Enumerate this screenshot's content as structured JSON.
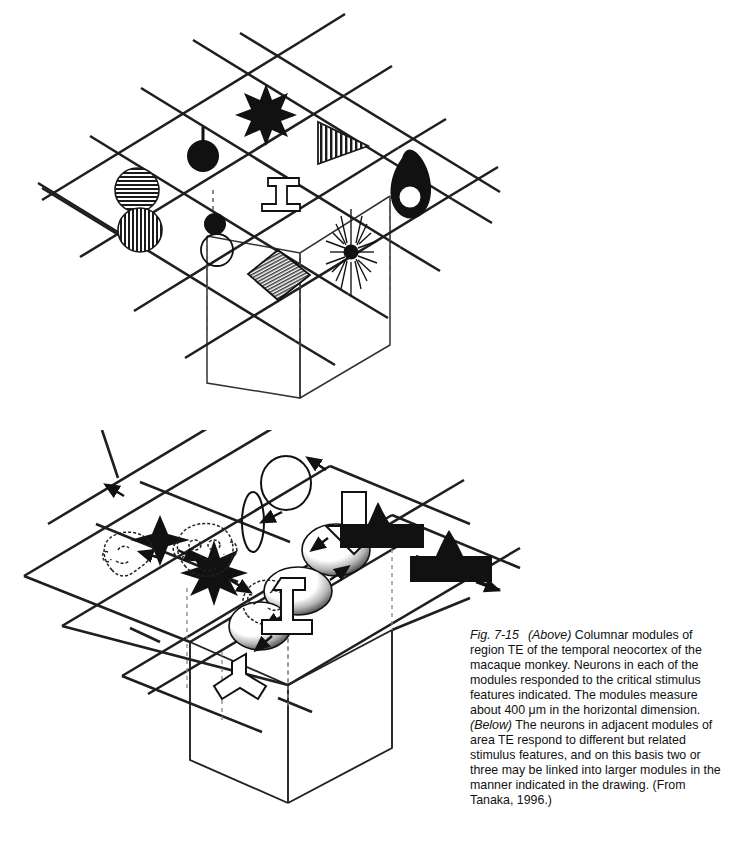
{
  "figure": {
    "number": "Fig. 7-15",
    "caption_segments": [
      {
        "text": "Fig. 7-15",
        "style": "italic"
      },
      {
        "text": "(Above)",
        "style": "italic"
      },
      {
        "text": "Columnar modules of region TE of the temporal neocortex of the macaque monkey. Neurons in each of the modules responded to the critical stimulus features indicated. The modules measure about 400 μm in the horizontal dimension.",
        "style": "normal"
      },
      {
        "text": "(Below)",
        "style": "italic"
      },
      {
        "text": "The neurons in adjacent modules of area TE respond to different but related stimulus features, and on this basis two or three may be linked into larger modules in the manner indicated in the drawing. (From Tanaka, 1996.)",
        "style": "normal"
      }
    ],
    "caption_full": "Fig. 7-15   (Above) Columnar modules of region TE of the temporal neocortex of the macaque monkey. Neurons in each of the modules responded to the critical stimulus features indicated. The modules measure about 400 μm in the horizontal dimension. (Below) The neurons in adjacent modules of area TE respond to different but related stimulus features, and on this basis two or three may be linked into larger modules in the manner indicated in the drawing. (From Tanaka, 1996.)",
    "measurement": "400 μm",
    "source": "Tanaka, 1996.",
    "region": "TE",
    "species": "macaque monkey"
  },
  "colors": {
    "ink": "#1a1a1a",
    "line": "#222222",
    "fill_black": "#111111",
    "paper": "#ffffff",
    "hatch_gray": "#555555",
    "dashed": "#777777"
  },
  "panel_above": {
    "label": "Above",
    "description": "Isometric grid of cortical columnar modules with a 3D column extending downward",
    "modules": [
      {
        "id": "m1",
        "feature": "striped-double-circle",
        "description": "horizontally striped circle above vertically striped circle"
      },
      {
        "id": "m2",
        "feature": "black-circle-with-stem",
        "description": "filled black disc with vertical stem above"
      },
      {
        "id": "m3",
        "feature": "eight-point-star",
        "description": "filled black eight-pointed star"
      },
      {
        "id": "m4",
        "feature": "small-black-disc-and-open-circle",
        "description": "small filled disc above an open outline circle"
      },
      {
        "id": "m5",
        "feature": "t-shape-outline",
        "description": "outline inverted T shape"
      },
      {
        "id": "m6",
        "feature": "striped-triangle",
        "description": "right-pointing triangle with vertical stripes"
      },
      {
        "id": "m7",
        "feature": "hatched-diamond",
        "description": "diamond filled with fine hatching"
      },
      {
        "id": "m8",
        "feature": "radial-starburst",
        "description": "starburst with many fine radiating lines"
      },
      {
        "id": "m9",
        "feature": "black-blob-with-hole",
        "description": "filled black rounded blob containing white circle"
      }
    ]
  },
  "panel_below": {
    "label": "Below",
    "description": "Adjacent modules linked into larger modules, connected by arrows",
    "groups": [
      {
        "id": "g1",
        "name": "ellipse-group",
        "items": [
          "narrow vertical ellipse",
          "round open circle"
        ],
        "arrows": 2
      },
      {
        "id": "g2",
        "name": "star-group",
        "items": [
          "four-point black star",
          "eight-point black star"
        ],
        "arrows": 2
      },
      {
        "id": "g3",
        "name": "shaded-ovoid-group",
        "items": [
          "shaded ovoid left",
          "shaded ovoid middle",
          "shaded ovoid upper right"
        ],
        "arrows": 2
      },
      {
        "id": "g4",
        "name": "monkey-face-group",
        "items": [
          "profile face left",
          "frontal face",
          "profile face right"
        ],
        "arrows": 2
      },
      {
        "id": "g5",
        "name": "t-shape-group",
        "items": [
          "Y shape outline",
          "T shape outline",
          "down arrow outline"
        ],
        "arrows": 2
      },
      {
        "id": "g6",
        "name": "black-peaked-group",
        "items": [
          "flat black bar with spike",
          "black block with peak"
        ],
        "arrows": 2
      }
    ]
  }
}
